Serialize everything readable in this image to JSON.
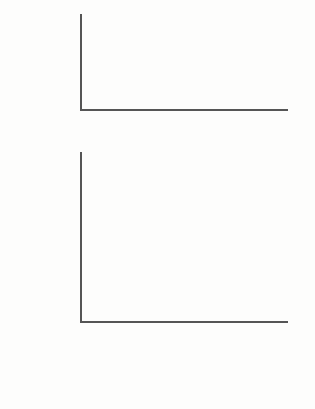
{
  "chart_data": [
    {
      "type": "bar",
      "orientation": "horizontal",
      "title": "",
      "xlabel": "",
      "ylabel": "",
      "xlim": [
        0,
        100
      ],
      "xticks": [
        "0%",
        "20%",
        "40%",
        "60%",
        "80%",
        "100%"
      ],
      "grid": false,
      "legend": "none",
      "categories": [
        "Should",
        "Should not",
        "Unsure"
      ],
      "values": [
        75,
        19,
        6
      ],
      "value_labels": [
        "75%",
        "19%",
        "6%"
      ],
      "series_color": "#7d7d7d"
    },
    {
      "type": "bar",
      "orientation": "horizontal",
      "title": "",
      "xlabel": "",
      "ylabel": "",
      "xlim": [
        0,
        100
      ],
      "xticks": [
        "0%",
        "20%",
        "40%",
        "60%",
        "80%",
        "100%"
      ],
      "grid": false,
      "legend": "bottom",
      "categories": [
        "Rural",
        "Central",
        "Southcentral",
        "Anchorage",
        "Southeast"
      ],
      "series": [
        {
          "name": "Support for opening ANWR",
          "color": "#3b3b3b",
          "values": [
            77,
            67,
            76,
            79,
            70
          ],
          "value_labels": [
            "77%",
            "67%",
            "76%",
            "79%",
            "70%"
          ]
        },
        {
          "name": "Does not support opening ANWR",
          "color": "#7d7d7d",
          "values": [
            20,
            17,
            22,
            17,
            20
          ],
          "value_labels": [
            "20%",
            "17%",
            "22%",
            "17%",
            "20%"
          ]
        }
      ]
    }
  ],
  "legend": {
    "items": [
      {
        "label": "Support for opening ANWR",
        "color": "#3b3b3b"
      },
      {
        "label": "Does not support opening ANWR",
        "color": "#7d7d7d"
      }
    ]
  }
}
